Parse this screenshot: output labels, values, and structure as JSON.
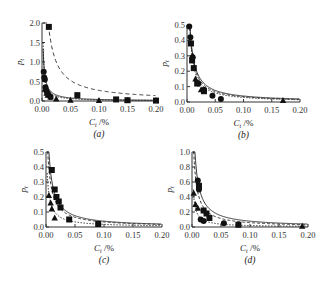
{
  "figure": {
    "panels": [
      {
        "id": "a",
        "caption": "(a)"
      },
      {
        "id": "b",
        "caption": "(b)"
      },
      {
        "id": "c",
        "caption": "(c)"
      },
      {
        "id": "d",
        "caption": "(d)"
      }
    ]
  },
  "chart_data": [
    {
      "type": "scatter",
      "panel": "(a)",
      "xlabel": "C_t /%",
      "ylabel": "p_t",
      "xlim": [
        0,
        0.2
      ],
      "ylim": [
        0,
        2.0
      ],
      "xticks": [
        "0.00",
        "0.05",
        "0.10",
        "0.15",
        "0.20"
      ],
      "yticks": [
        "0.0",
        "0.5",
        "1.0",
        "1.5",
        "2.0"
      ],
      "series": [
        {
          "name": "squares (dashed fit)",
          "marker": "square",
          "x": [
            0.012,
            0.062,
            0.13,
            0.15,
            0.2
          ],
          "y": [
            1.9,
            0.15,
            0.04,
            0.02,
            0.01
          ]
        },
        {
          "name": "circles",
          "marker": "circle",
          "x": [
            0.003,
            0.004,
            0.005,
            0.006,
            0.008,
            0.01,
            0.012,
            0.015
          ],
          "y": [
            0.75,
            0.6,
            0.55,
            0.35,
            0.25,
            0.2,
            0.15,
            0.1
          ]
        },
        {
          "name": "triangles (solid fit)",
          "marker": "triangle",
          "x": [
            0.005,
            0.008,
            0.01,
            0.015,
            0.025,
            0.05,
            0.1,
            0.15,
            0.2
          ],
          "y": [
            0.3,
            0.2,
            0.15,
            0.1,
            0.05,
            0.02,
            0.01,
            0.01,
            0.01
          ]
        }
      ]
    },
    {
      "type": "scatter",
      "panel": "(b)",
      "xlabel": "C_t /%",
      "ylabel": "p_t",
      "xlim": [
        0,
        0.2
      ],
      "ylim": [
        0,
        0.5
      ],
      "xticks": [
        "0.00",
        "0.05",
        "0.10",
        "0.15",
        "0.20"
      ],
      "yticks": [
        "0.0",
        "0.1",
        "0.2",
        "0.3",
        "0.4",
        "0.5"
      ],
      "series": [
        {
          "name": "circles",
          "marker": "circle",
          "x": [
            0.004,
            0.006,
            0.01,
            0.02,
            0.03,
            0.045,
            0.06
          ],
          "y": [
            0.49,
            0.42,
            0.29,
            0.12,
            0.08,
            0.04,
            0.02
          ]
        },
        {
          "name": "squares",
          "marker": "square",
          "x": [
            0.007,
            0.009,
            0.012,
            0.018,
            0.03
          ],
          "y": [
            0.38,
            0.27,
            0.22,
            0.12,
            0.07
          ]
        },
        {
          "name": "triangles",
          "marker": "triangle",
          "x": [
            0.01,
            0.015,
            0.025,
            0.17
          ],
          "y": [
            0.3,
            0.15,
            0.08,
            0.01
          ]
        }
      ]
    },
    {
      "type": "scatter",
      "panel": "(c)",
      "xlabel": "C_t /%",
      "ylabel": "p_t",
      "xlim": [
        0,
        0.2
      ],
      "ylim": [
        0,
        0.5
      ],
      "xticks": [
        "0.00",
        "0.05",
        "0.10",
        "0.15",
        "0.20"
      ],
      "yticks": [
        "0.0",
        "0.1",
        "0.2",
        "0.3",
        "0.4",
        "0.5"
      ],
      "series": [
        {
          "name": "squares",
          "marker": "square",
          "x": [
            0.01,
            0.015,
            0.018,
            0.022,
            0.025,
            0.04,
            0.09
          ],
          "y": [
            0.38,
            0.25,
            0.2,
            0.17,
            0.13,
            0.05,
            0.02
          ]
        },
        {
          "name": "triangles",
          "marker": "triangle",
          "x": [
            0.005,
            0.008,
            0.01,
            0.015
          ],
          "y": [
            0.21,
            0.16,
            0.12,
            0.06
          ]
        }
      ]
    },
    {
      "type": "scatter",
      "panel": "(d)",
      "xlabel": "C_t /%",
      "ylabel": "p_t",
      "xlim": [
        0,
        0.2
      ],
      "ylim": [
        0,
        1.0
      ],
      "xticks": [
        "0.00",
        "0.05",
        "0.10",
        "0.15",
        "0.20"
      ],
      "yticks": [
        "0.0",
        "0.2",
        "0.4",
        "0.6",
        "0.8",
        "1.0"
      ],
      "series": [
        {
          "name": "circles",
          "marker": "circle",
          "x": [
            0.01,
            0.012,
            0.015,
            0.02,
            0.055
          ],
          "y": [
            0.62,
            0.5,
            0.1,
            0.08,
            0.05
          ]
        },
        {
          "name": "squares",
          "marker": "square",
          "x": [
            0.012,
            0.02,
            0.025,
            0.03,
            0.08
          ],
          "y": [
            0.55,
            0.22,
            0.18,
            0.12,
            0.03
          ]
        },
        {
          "name": "triangles",
          "marker": "triangle",
          "x": [
            0.003,
            0.006,
            0.01,
            0.19
          ],
          "y": [
            0.45,
            0.3,
            0.25,
            0.01
          ]
        }
      ]
    }
  ]
}
